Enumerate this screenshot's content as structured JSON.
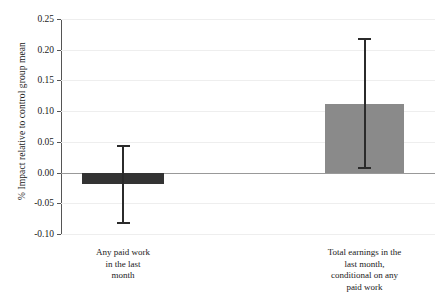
{
  "chart_data": {
    "type": "bar",
    "title": "",
    "xlabel": "",
    "ylabel": "% Impact relative to control group mean",
    "ylim": [
      -0.1,
      0.25
    ],
    "ytick_labels": [
      "0.25",
      "0.20",
      "0.15",
      "0.10",
      "0.05",
      "0.00",
      "-0.05",
      "-0.10"
    ],
    "ytick_values": [
      0.25,
      0.2,
      0.15,
      0.1,
      0.05,
      0.0,
      -0.05,
      -0.1
    ],
    "grid": true,
    "legend": "none",
    "categories": [
      "Any paid work in the last month",
      "Total earnings in the last month, conditional on any paid work"
    ],
    "category_label_lines": [
      [
        "Any paid work",
        "in the last",
        "month"
      ],
      [
        "Total earnings in the",
        "last month,",
        "conditional on any",
        "paid work"
      ]
    ],
    "values": [
      -0.018,
      0.112
    ],
    "error_low": [
      -0.082,
      0.008
    ],
    "error_high": [
      0.044,
      0.217
    ],
    "bar_colors": [
      "#333333",
      "#8a8a8a"
    ],
    "errorbar_color": "#2b2b2b",
    "zero_line_color": "#999999",
    "gridline_color": "#eeeeee",
    "axis_color": "#555555",
    "background_color": "#ffffff"
  }
}
